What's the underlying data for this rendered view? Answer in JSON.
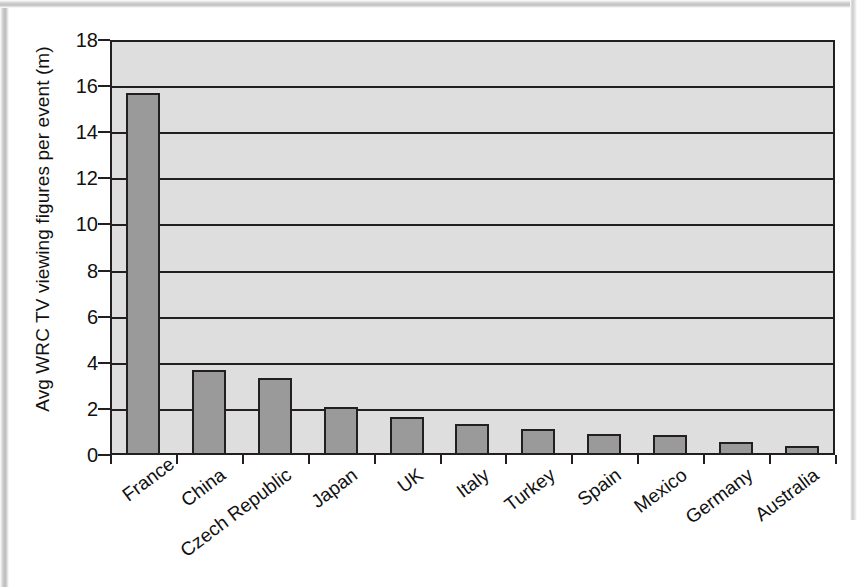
{
  "chart_data": {
    "type": "bar",
    "title": "",
    "subtitle": "",
    "xlabel": "",
    "ylabel": "Avg WRC TV viewing figures per event (m)",
    "categories": [
      "France",
      "China",
      "Czech Republic",
      "Japan",
      "UK",
      "Italy",
      "Turkey",
      "Spain",
      "Mexico",
      "Germany",
      "Australia"
    ],
    "values": [
      15.7,
      3.7,
      3.35,
      2.1,
      1.65,
      1.35,
      1.15,
      0.9,
      0.85,
      0.55,
      0.4
    ],
    "ylim": [
      0,
      18
    ],
    "ytick_values": [
      0,
      2,
      4,
      6,
      8,
      10,
      12,
      14,
      16,
      18
    ],
    "ytick_labels": [
      "0",
      "2",
      "4",
      "6",
      "8",
      "10",
      "12",
      "14",
      "16",
      "18"
    ],
    "ytick_step": 2,
    "grid": "horizontal",
    "legend": "none",
    "series_name": "Avg WRC TV viewing figures per event (m)",
    "bar_fill_color": "#9a9a9a",
    "bar_border_color": "#231f20",
    "plot_background_color": "#dedede",
    "gridline_color": "#231f20",
    "axis_color": "#231f20",
    "text_color": "#111111",
    "xlabel_rotation_deg": -37
  }
}
